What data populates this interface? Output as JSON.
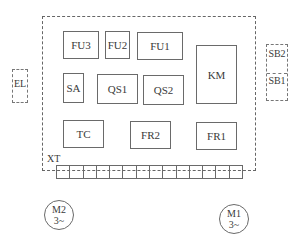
{
  "panel": {
    "components": [
      {
        "id": "fu3",
        "label": "FU3"
      },
      {
        "id": "fu2",
        "label": "FU2"
      },
      {
        "id": "fu1",
        "label": "FU1"
      },
      {
        "id": "km",
        "label": "KM"
      },
      {
        "id": "sa",
        "label": "SA"
      },
      {
        "id": "qs1",
        "label": "QS1"
      },
      {
        "id": "qs2",
        "label": "QS2"
      },
      {
        "id": "tc",
        "label": "TC"
      },
      {
        "id": "fr2",
        "label": "FR2"
      },
      {
        "id": "fr1",
        "label": "FR1"
      }
    ],
    "terminal_block": {
      "label": "XT",
      "cell_count": 14
    }
  },
  "external": {
    "lamp": {
      "label": "EL"
    },
    "buttons": [
      {
        "label": "SB2"
      },
      {
        "label": "SB1"
      }
    ]
  },
  "motors": [
    {
      "name": "M2",
      "phase": "3~"
    },
    {
      "name": "M1",
      "phase": "3~"
    }
  ]
}
